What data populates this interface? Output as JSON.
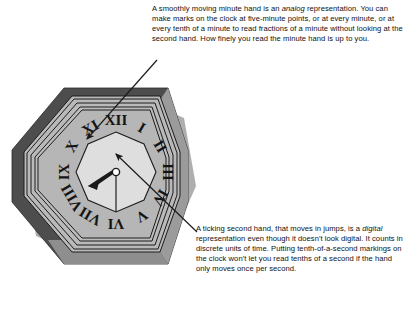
{
  "figure": {
    "name": "analog-vs-digital-clock-diagram",
    "background_color": "#ffffff"
  },
  "clock": {
    "name": "octagonal-roman-numeral-clock",
    "shape": "octagon",
    "center": {
      "x": 116,
      "y": 172
    },
    "colors": {
      "outer_frame_dark": "#4d4d4d",
      "outer_frame_light": "#a8a8a8",
      "dial_ring": "#b4b4b4",
      "inner_face": "#dcdcdc",
      "outline": "#1c1c1c",
      "hand": "#1a1a1a",
      "hub_fill": "#ffffff"
    },
    "numerals": [
      "XII",
      "I",
      "II",
      "III",
      "IV",
      "V",
      "VI",
      "VII",
      "VIII",
      "IX",
      "X",
      "XI"
    ],
    "hands": [
      {
        "name": "hour-hand",
        "points_to": "VIII",
        "angle_deg": 240,
        "length": 26,
        "style": "tapered"
      },
      {
        "name": "minute-hand",
        "points_to": "VI",
        "angle_deg": 180,
        "length": 40,
        "style": "thin"
      }
    ]
  },
  "callouts": {
    "analog": {
      "id": "callout-analog",
      "text": "A smoothly moving minute hand is an analog representation. You can make marks on the clock at five-minute points, or at every minute, or at every tenth of a minute to read fractions of a minute without looking at the second hand. How finely you read the minute hand is up to you.",
      "emphasis_word": "analog",
      "segments": {
        "before": "A smoothly moving minute hand is an ",
        "italic": "analog",
        "after": " representation. You can make marks on the clock at five-minute points, or at every minute, or at every tenth of a minute to read fractions of a minute without looking at the second hand. How finely you read the minute hand is up to you."
      },
      "leader_target": "minute-hand"
    },
    "digital": {
      "id": "callout-digital",
      "text": "A ticking second hand, that moves in jumps, is a digital representation even though it doesn't look digital. It counts in discrete units of time. Putting tenth-of-a-second markings on the clock won't let you read tenths of a second if the hand only moves once per second.",
      "emphasis_word": "digital",
      "segments": {
        "before": "A ticking second hand, that moves in jumps, is a ",
        "italic": "digital",
        "after": " representation even though it doesn't look digital. It counts in discrete units of time. Putting tenth-of-a-second markings on the clock won't let you read tenths of a second if the hand only moves once per second."
      },
      "leader_target": "second-hand"
    }
  },
  "leader_lines": [
    {
      "name": "leader-line-analog",
      "from": {
        "x": 156,
        "y": 61
      },
      "to": {
        "x": 85,
        "y": 141
      },
      "arrow_at": "to"
    },
    {
      "name": "leader-line-digital",
      "from": {
        "x": 196,
        "y": 231
      },
      "to": {
        "x": 114,
        "y": 153
      },
      "arrow_at": "to"
    }
  ]
}
